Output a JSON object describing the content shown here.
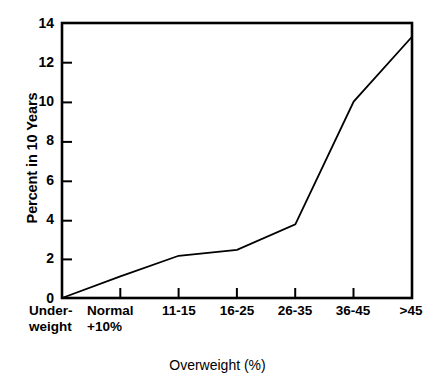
{
  "chart_data": {
    "type": "line",
    "title": "",
    "subtitle": "",
    "xlabel": "Overweight (%)",
    "ylabel": "Percent in 10 Years",
    "categories": [
      "Under-\nweight",
      "Normal\n+10%",
      "11-15",
      "16-25",
      "26-35",
      "36-45",
      ">45"
    ],
    "category_labels_flat": [
      "Under-weight",
      "Normal +10%",
      "11-15",
      "16-25",
      "26-35",
      "36-45",
      ">45"
    ],
    "values": [
      0,
      1.1,
      2.15,
      2.45,
      3.75,
      10.0,
      13.3
    ],
    "series": [
      {
        "name": "Percent in 10 Years",
        "values": [
          0,
          1.1,
          2.15,
          2.45,
          3.75,
          10.0,
          13.3
        ],
        "color": "#000000"
      }
    ],
    "ylim": [
      0,
      14
    ],
    "yticks": [
      0,
      2,
      4,
      6,
      8,
      10,
      12,
      14
    ],
    "ytick_labels": [
      "0",
      "2",
      "4",
      "6",
      "8",
      "10",
      "12",
      "14"
    ],
    "grid": false,
    "legend": "none",
    "frame": "full-box",
    "line_color": "#000000",
    "line_width": 1.8,
    "markers": "none"
  },
  "axes": {
    "y_title": "Percent in 10 Years",
    "x_title": "Overweight (%)"
  }
}
